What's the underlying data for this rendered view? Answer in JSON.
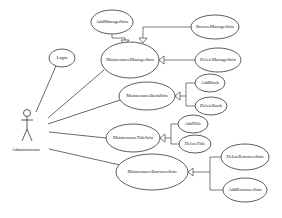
{
  "diagram": {
    "type": "use-case",
    "actor": {
      "label": "Administrator"
    },
    "use_cases": {
      "login": "Login",
      "maintenance_manager": "MaintenanceManagerInfo",
      "add_manager": "AddManagerInfo",
      "browse_manager": "BrowseManagerInfo",
      "delete_manager": "DeleteManagerInfo",
      "maintenance_book": "MaintenanceBookInfo",
      "add_book": "AddBook",
      "delete_book": "DeleteBook",
      "maintenance_title": "MaintenanceTitleInfo",
      "add_title": "AddTitle",
      "delete_title": "DeleteTitle",
      "maintenance_borrower": "MaintenanceBorrowerInfo",
      "delete_borrower": "DeleteBorrowerInfo",
      "add_borrower": "AddBorrowerInfo"
    },
    "associations": [
      [
        "Administrator",
        "Login"
      ],
      [
        "Administrator",
        "MaintenanceManagerInfo"
      ],
      [
        "Administrator",
        "MaintenanceBookInfo"
      ],
      [
        "Administrator",
        "MaintenanceTitleInfo"
      ],
      [
        "Administrator",
        "MaintenanceBorrowerInfo"
      ]
    ],
    "generalizations": [
      [
        "AddManagerInfo",
        "MaintenanceManagerInfo"
      ],
      [
        "BrowseManagerInfo",
        "MaintenanceManagerInfo"
      ],
      [
        "DeleteManagerInfo",
        "MaintenanceManagerInfo"
      ],
      [
        "AddBook",
        "MaintenanceBookInfo"
      ],
      [
        "DeleteBook",
        "MaintenanceBookInfo"
      ],
      [
        "AddTitle",
        "MaintenanceTitleInfo"
      ],
      [
        "DeleteTitle",
        "MaintenanceTitleInfo"
      ],
      [
        "DeleteBorrowerInfo",
        "MaintenanceBorrowerInfo"
      ],
      [
        "AddBorrowerInfo",
        "MaintenanceBorrowerInfo"
      ]
    ]
  }
}
